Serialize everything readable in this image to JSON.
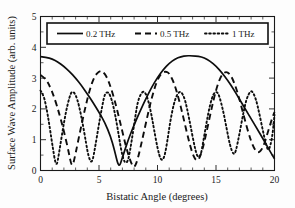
{
  "chart_data": {
    "type": "line",
    "title": "",
    "xlabel": "Bistatic Angle (degrees)",
    "ylabel": "Surface Wave Amplitude (arb. units)",
    "xlim": [
      0,
      20
    ],
    "ylim": [
      0,
      5
    ],
    "xticks": [
      0,
      5,
      10,
      15,
      20
    ],
    "yticks": [
      0,
      1,
      2,
      3,
      4,
      5
    ],
    "xtick_labels": [
      "0",
      "5",
      "10",
      "15",
      "20"
    ],
    "ytick_labels": [
      "0",
      "1",
      "2",
      "3",
      "4",
      "5"
    ],
    "x_minor_tick_step": 1,
    "y_minor_tick_step": 0.5,
    "grid": false,
    "legend_position": "upper center inside",
    "legend_border": true,
    "series": [
      {
        "name": "0.2 THz",
        "style": "solid",
        "envelope_peak": 3.72,
        "period_degrees": 13.5,
        "first_min_degrees": 6.7,
        "x": [
          0,
          0.5,
          1,
          1.5,
          2,
          2.5,
          3,
          3.5,
          4,
          4.5,
          5,
          5.5,
          6,
          6.3,
          6.7,
          7,
          7.5,
          8,
          8.5,
          9,
          9.5,
          10,
          10.5,
          11,
          11.5,
          12,
          12.5,
          13,
          13.5,
          14,
          14.5,
          15,
          15.5,
          16,
          16.5,
          17,
          17.5,
          18,
          18.5,
          19,
          19.5,
          20
        ],
        "y": [
          3.7,
          3.68,
          3.62,
          3.52,
          3.38,
          3.21,
          3.0,
          2.76,
          2.49,
          2.2,
          1.89,
          1.56,
          1.09,
          0.7,
          0.06,
          0.42,
          1.0,
          1.48,
          1.92,
          2.33,
          2.7,
          3.02,
          3.28,
          3.48,
          3.62,
          3.7,
          3.73,
          3.72,
          3.71,
          3.66,
          3.55,
          3.39,
          3.18,
          2.93,
          2.64,
          2.32,
          2.0,
          1.68,
          1.36,
          1.04,
          0.7,
          0.38
        ]
      },
      {
        "name": "0.5 THz",
        "style": "dashed",
        "envelope_peak": 3.25,
        "period_degrees": 5.4,
        "first_min_degrees": 2.7,
        "x": [
          0,
          0.4,
          0.8,
          1.2,
          1.6,
          2,
          2.4,
          2.7,
          3,
          3.4,
          3.8,
          4.2,
          4.6,
          5,
          5.3,
          5.7,
          6.1,
          6.5,
          6.9,
          7.3,
          7.7,
          8,
          8.3,
          8.7,
          9.1,
          9.5,
          9.9,
          10.3,
          10.7,
          11,
          11.4,
          11.8,
          12.2,
          12.6,
          13,
          13.4,
          13.8,
          14.2,
          14.6,
          15,
          15.4,
          15.8,
          16.2,
          16.6,
          17,
          17.4,
          17.8,
          18.2,
          18.6,
          19,
          19.4,
          19.8,
          20
        ],
        "y": [
          3.1,
          3.0,
          2.74,
          2.35,
          1.85,
          1.28,
          0.62,
          0.05,
          0.55,
          1.3,
          2.0,
          2.62,
          3.05,
          3.22,
          3.24,
          3.02,
          2.6,
          2.05,
          1.42,
          0.78,
          0.28,
          0.06,
          0.35,
          1.0,
          1.7,
          2.35,
          2.86,
          3.16,
          3.22,
          3.16,
          2.86,
          2.36,
          1.74,
          1.08,
          0.52,
          0.26,
          0.6,
          1.26,
          1.98,
          2.62,
          3.06,
          3.22,
          3.14,
          2.82,
          2.32,
          1.74,
          1.18,
          0.74,
          0.55,
          0.72,
          1.2,
          1.7,
          1.9
        ]
      },
      {
        "name": "1 THz",
        "style": "dotted",
        "envelope_peak": 2.62,
        "period_degrees": 2.7,
        "first_min_degrees": 1.35,
        "x": [
          0,
          0.25,
          0.5,
          0.75,
          1,
          1.35,
          1.6,
          1.9,
          2.2,
          2.5,
          2.7,
          3,
          3.3,
          3.6,
          3.9,
          4.1,
          4.4,
          4.7,
          5,
          5.3,
          5.5,
          5.8,
          6.1,
          6.4,
          6.7,
          6.9,
          7.2,
          7.5,
          7.8,
          8.1,
          8.3,
          8.6,
          8.9,
          9.2,
          9.5,
          9.7,
          10,
          10.3,
          10.6,
          10.9,
          11.1,
          11.4,
          11.7,
          12,
          12.3,
          12.5,
          12.8,
          13.1,
          13.4,
          13.7,
          13.9,
          14.2,
          14.5,
          14.8,
          15.1,
          15.3,
          15.6,
          15.9,
          16.2,
          16.5,
          16.7,
          17,
          17.3,
          17.6,
          17.9,
          18.1,
          18.4,
          18.7,
          19,
          19.3,
          19.5,
          19.8,
          20
        ],
        "y": [
          2.6,
          2.46,
          2.06,
          1.5,
          0.86,
          0.05,
          0.6,
          1.32,
          1.96,
          2.42,
          2.58,
          2.48,
          2.1,
          1.54,
          0.88,
          0.45,
          0.2,
          0.82,
          1.52,
          2.14,
          2.5,
          2.56,
          2.3,
          1.78,
          1.12,
          0.64,
          0.22,
          0.3,
          0.98,
          1.74,
          2.22,
          2.52,
          2.58,
          2.3,
          1.78,
          1.34,
          0.72,
          0.3,
          0.42,
          1.1,
          1.62,
          2.18,
          2.5,
          2.58,
          2.36,
          2.06,
          1.5,
          0.9,
          0.42,
          0.48,
          0.92,
          1.58,
          2.16,
          2.52,
          2.56,
          2.4,
          1.96,
          1.38,
          0.8,
          0.5,
          0.62,
          1.18,
          1.8,
          2.32,
          2.56,
          2.58,
          2.34,
          1.86,
          1.3,
          0.8,
          0.62,
          1.04,
          1.8
        ]
      }
    ]
  },
  "legend": {
    "items": [
      {
        "label": "0.2 THz",
        "style": "solid"
      },
      {
        "label": "0.5 THz",
        "style": "dashed"
      },
      {
        "label": "1 THz",
        "style": "dotted"
      }
    ]
  }
}
